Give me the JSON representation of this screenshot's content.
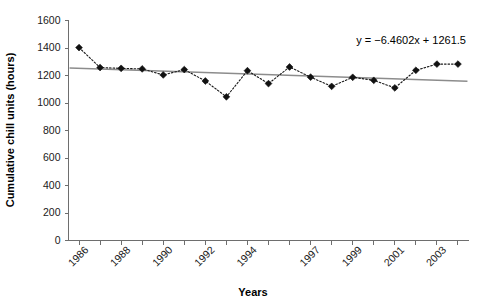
{
  "chart_data": {
    "type": "line",
    "title": "",
    "xlabel": "Years",
    "ylabel": "Cumulative chill units (hours)",
    "ylim": [
      0,
      1600
    ],
    "ytick_values": [
      0,
      200,
      400,
      600,
      800,
      1000,
      1200,
      1400,
      1600
    ],
    "ytick_labels": [
      "0",
      "200",
      "400",
      "600",
      "800",
      "1000",
      "1200",
      "1400",
      "1600"
    ],
    "grid": false,
    "legend": "none",
    "x": [
      1986,
      1987,
      1988,
      1989,
      1990,
      1991,
      1992,
      1993,
      1994,
      1995,
      1996,
      1997,
      1998,
      1999,
      2000,
      2001,
      2002,
      2003,
      2004
    ],
    "xtick_labels": [
      "1986",
      "",
      "1988",
      "",
      "1990",
      "",
      "1992",
      "",
      "1994",
      "",
      "",
      "1997",
      "",
      "1999",
      "",
      "2001",
      "",
      "2003",
      ""
    ],
    "xtick_labels_shown": [
      "1986",
      "1988",
      "1990",
      "1992",
      "1994",
      "1997",
      "1999",
      "2001",
      "2003"
    ],
    "categories": [
      "1986",
      "1987",
      "1988",
      "1989",
      "1990",
      "1991",
      "1992",
      "1993",
      "1994",
      "1995",
      "1996",
      "1997",
      "1998",
      "1999",
      "2000",
      "2001",
      "2002",
      "2003",
      "2004"
    ],
    "values": [
      1403,
      1258,
      1252,
      1248,
      1204,
      1243,
      1160,
      1045,
      1235,
      1141,
      1262,
      1188,
      1121,
      1187,
      1165,
      1110,
      1238,
      1283,
      1283
    ],
    "series": [
      {
        "name": "Cumulative chill units",
        "values": [
          1403,
          1258,
          1252,
          1248,
          1204,
          1243,
          1160,
          1045,
          1235,
          1141,
          1262,
          1188,
          1121,
          1187,
          1165,
          1110,
          1238,
          1283,
          1283
        ],
        "marker": "diamond",
        "linestyle": "dotted",
        "color": "#111111"
      }
    ],
    "trendline": {
      "equation": "y = −6.4602x + 1261.5",
      "slope": -6.4602,
      "intercept": 1261.5,
      "color": "#8c8c8c",
      "y_start": 1255.0,
      "y_end": 1158.1
    },
    "annotations": [
      {
        "text": "y = −6.4602x + 1261.5",
        "x": 2002,
        "y": 1490
      }
    ]
  },
  "axis": {
    "y_title": "Cumulative chill units (hours)",
    "x_title": "Years"
  },
  "colors": {
    "axis": "#6e6e6e",
    "series": "#111111",
    "trend": "#8c8c8c",
    "text": "#1a1a1a",
    "background": "#ffffff"
  }
}
